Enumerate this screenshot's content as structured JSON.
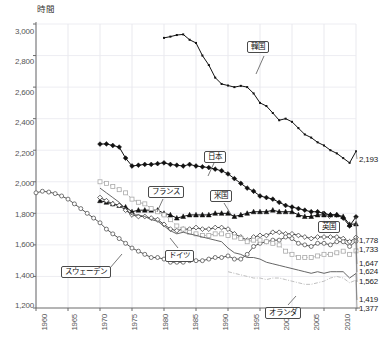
{
  "chart": {
    "type": "line",
    "yaxis_title": "時間",
    "ylabel": "時間",
    "xlabel": ""
  },
  "yticks": [
    "3,000",
    "2,800",
    "2,600",
    "2,400",
    "2,200",
    "2,000",
    "1,800",
    "1,600",
    "1,400",
    "1,200"
  ],
  "xticks": [
    "1960",
    "1965",
    "1970",
    "1975",
    "1980",
    "1985",
    "1990",
    "1995",
    "2000",
    "2005",
    "2010"
  ],
  "callouts": [
    {
      "name": "korea",
      "label": "韓国"
    },
    {
      "name": "japan",
      "label": "日本"
    },
    {
      "name": "france",
      "label": "フランス"
    },
    {
      "name": "usa",
      "label": "米国"
    },
    {
      "name": "uk",
      "label": "英国"
    },
    {
      "name": "germany",
      "label": "ドイツ"
    },
    {
      "name": "sweden",
      "label": "スウェーデン"
    },
    {
      "name": "netherlands",
      "label": "オランダ"
    }
  ],
  "end_labels": [
    {
      "name": "korea",
      "value": "2,193"
    },
    {
      "name": "japan",
      "value": "1,778"
    },
    {
      "name": "usa",
      "value": "1,733"
    },
    {
      "name": "uk",
      "value": "1,647"
    },
    {
      "name": "sweden",
      "value": "1,624"
    },
    {
      "name": "france",
      "value": "1,562"
    },
    {
      "name": "germany",
      "value": "1,419"
    },
    {
      "name": "netherlands",
      "value": "1,377"
    }
  ],
  "chart_data": {
    "type": "line",
    "title": "",
    "xlabel": "",
    "ylabel": "時間",
    "xlim": [
      1960,
      2010
    ],
    "ylim": [
      1200,
      3000
    ],
    "yticks": [
      1200,
      1400,
      1600,
      1800,
      2000,
      2200,
      2400,
      2600,
      2800,
      3000
    ],
    "xticks": [
      1960,
      1965,
      1970,
      1975,
      1980,
      1985,
      1990,
      1995,
      2000,
      2005,
      2010
    ],
    "grid": true,
    "legend": "callout-labels-on-plot",
    "series": [
      {
        "name": "韓国",
        "name_en": "Korea",
        "marker": "small-filled-square",
        "color": "#111111",
        "x": [
          1980,
          1981,
          1982,
          1983,
          1984,
          1985,
          1986,
          1987,
          1988,
          1989,
          1990,
          1991,
          1992,
          1993,
          1994,
          1995,
          1996,
          1997,
          1998,
          1999,
          2000,
          2001,
          2002,
          2003,
          2004,
          2005,
          2006,
          2007,
          2008,
          2009,
          2010
        ],
        "values": [
          2912,
          2920,
          2930,
          2934,
          2900,
          2880,
          2800,
          2740,
          2660,
          2620,
          2610,
          2600,
          2608,
          2600,
          2560,
          2500,
          2480,
          2436,
          2390,
          2400,
          2380,
          2340,
          2300,
          2280,
          2250,
          2230,
          2200,
          2180,
          2150,
          2120,
          2193
        ]
      },
      {
        "name": "日本",
        "name_en": "Japan",
        "marker": "filled-diamond",
        "color": "#111111",
        "x": [
          1970,
          1971,
          1972,
          1973,
          1974,
          1975,
          1976,
          1977,
          1978,
          1979,
          1980,
          1981,
          1982,
          1983,
          1984,
          1985,
          1986,
          1987,
          1988,
          1989,
          1990,
          1991,
          1992,
          1993,
          1994,
          1995,
          1996,
          1997,
          1998,
          1999,
          2000,
          2001,
          2002,
          2003,
          2004,
          2005,
          2006,
          2007,
          2008,
          2009,
          2010
        ],
        "values": [
          2239,
          2240,
          2230,
          2220,
          2150,
          2100,
          2105,
          2110,
          2110,
          2115,
          2120,
          2110,
          2105,
          2100,
          2110,
          2100,
          2095,
          2090,
          2080,
          2070,
          2050,
          2020,
          1990,
          1960,
          1940,
          1910,
          1900,
          1890,
          1870,
          1850,
          1840,
          1830,
          1820,
          1810,
          1810,
          1800,
          1790,
          1790,
          1770,
          1720,
          1778
        ]
      },
      {
        "name": "米国",
        "name_en": "USA",
        "marker": "filled-triangle",
        "color": "#111111",
        "x": [
          1970,
          1971,
          1972,
          1973,
          1974,
          1975,
          1976,
          1977,
          1978,
          1979,
          1980,
          1981,
          1982,
          1983,
          1984,
          1985,
          1986,
          1987,
          1988,
          1989,
          1990,
          1991,
          1992,
          1993,
          1994,
          1995,
          1996,
          1997,
          1998,
          1999,
          2000,
          2001,
          2002,
          2003,
          2004,
          2005,
          2006,
          2007,
          2008,
          2009,
          2010
        ],
        "values": [
          1880,
          1870,
          1860,
          1850,
          1840,
          1810,
          1820,
          1820,
          1820,
          1820,
          1800,
          1790,
          1770,
          1780,
          1790,
          1790,
          1790,
          1790,
          1800,
          1800,
          1800,
          1780,
          1790,
          1800,
          1810,
          1810,
          1810,
          1820,
          1810,
          1810,
          1810,
          1790,
          1780,
          1780,
          1790,
          1790,
          1790,
          1790,
          1780,
          1730,
          1733
        ]
      },
      {
        "name": "英国",
        "name_en": "UK",
        "marker": "open-diamond",
        "color": "#444444",
        "x": [
          1970,
          1971,
          1972,
          1973,
          1974,
          1975,
          1976,
          1977,
          1978,
          1979,
          1980,
          1981,
          1982,
          1983,
          1984,
          1985,
          1986,
          1987,
          1988,
          1989,
          1990,
          1991,
          1992,
          1993,
          1994,
          1995,
          1996,
          1997,
          1998,
          1999,
          2000,
          2001,
          2002,
          2003,
          2004,
          2005,
          2006,
          2007,
          2008,
          2009,
          2010
        ],
        "values": [
          1900,
          1880,
          1860,
          1850,
          1820,
          1790,
          1780,
          1780,
          1770,
          1760,
          1730,
          1700,
          1690,
          1700,
          1700,
          1710,
          1700,
          1700,
          1710,
          1710,
          1700,
          1670,
          1650,
          1630,
          1650,
          1660,
          1660,
          1680,
          1680,
          1670,
          1670,
          1660,
          1650,
          1640,
          1650,
          1650,
          1650,
          1650,
          1640,
          1620,
          1647
        ]
      },
      {
        "name": "スウェーデン",
        "name_en": "Sweden",
        "marker": "open-circle",
        "color": "#555555",
        "x": [
          1960,
          1961,
          1962,
          1963,
          1964,
          1965,
          1966,
          1967,
          1968,
          1969,
          1970,
          1971,
          1972,
          1973,
          1974,
          1975,
          1976,
          1977,
          1978,
          1979,
          1980,
          1981,
          1982,
          1983,
          1984,
          1985,
          1986,
          1987,
          1988,
          1989,
          1990,
          1991,
          1992,
          1993,
          1994,
          1995,
          1996,
          1997,
          1998,
          1999,
          2000,
          2001,
          2002,
          2003,
          2004,
          2005,
          2006,
          2007,
          2008,
          2009,
          2010
        ],
        "values": [
          1930,
          1940,
          1935,
          1925,
          1910,
          1890,
          1860,
          1830,
          1800,
          1770,
          1740,
          1700,
          1670,
          1640,
          1610,
          1580,
          1560,
          1540,
          1520,
          1520,
          1510,
          1490,
          1490,
          1490,
          1500,
          1500,
          1500,
          1510,
          1520,
          1520,
          1530,
          1510,
          1510,
          1540,
          1590,
          1610,
          1620,
          1630,
          1630,
          1650,
          1640,
          1610,
          1600,
          1590,
          1610,
          1610,
          1600,
          1620,
          1620,
          1590,
          1624
        ]
      },
      {
        "name": "フランス",
        "name_en": "France",
        "marker": "open-square-dotted",
        "color": "#aaaaaa",
        "x": [
          1970,
          1971,
          1972,
          1973,
          1974,
          1975,
          1976,
          1977,
          1978,
          1979,
          1980,
          1981,
          1982,
          1983,
          1984,
          1985,
          1986,
          1987,
          1988,
          1989,
          1990,
          1991,
          1992,
          1993,
          1994,
          1995,
          1996,
          1997,
          1998,
          1999,
          2000,
          2001,
          2002,
          2003,
          2004,
          2005,
          2006,
          2007,
          2008,
          2009,
          2010
        ],
        "values": [
          2000,
          1990,
          1970,
          1950,
          1930,
          1890,
          1870,
          1860,
          1830,
          1810,
          1790,
          1760,
          1720,
          1700,
          1680,
          1670,
          1660,
          1660,
          1670,
          1670,
          1660,
          1650,
          1640,
          1620,
          1630,
          1630,
          1620,
          1610,
          1600,
          1560,
          1540,
          1520,
          1520,
          1520,
          1530,
          1540,
          1540,
          1550,
          1560,
          1540,
          1562
        ]
      },
      {
        "name": "ドイツ",
        "name_en": "Germany",
        "marker": "none-line",
        "color": "#666666",
        "x": [
          1970,
          1971,
          1972,
          1973,
          1974,
          1975,
          1976,
          1977,
          1978,
          1979,
          1980,
          1981,
          1982,
          1983,
          1984,
          1985,
          1986,
          1987,
          1988,
          1989,
          1990,
          1991,
          1992,
          1993,
          1994,
          1995,
          1996,
          1997,
          1998,
          1999,
          2000,
          2001,
          2002,
          2003,
          2004,
          2005,
          2006,
          2007,
          2008,
          2009,
          2010
        ],
        "values": [
          1960,
          1930,
          1900,
          1870,
          1830,
          1790,
          1790,
          1780,
          1760,
          1750,
          1720,
          1690,
          1670,
          1680,
          1670,
          1660,
          1650,
          1640,
          1630,
          1620,
          1580,
          1550,
          1540,
          1520,
          1520,
          1510,
          1490,
          1480,
          1470,
          1460,
          1450,
          1440,
          1430,
          1420,
          1430,
          1420,
          1430,
          1430,
          1430,
          1390,
          1419
        ]
      },
      {
        "name": "オランダ",
        "name_en": "Netherlands",
        "marker": "dash-dot",
        "color": "#c0c0c0",
        "x": [
          1990,
          1991,
          1992,
          1993,
          1994,
          1995,
          1996,
          1997,
          1998,
          1999,
          2000,
          2001,
          2002,
          2003,
          2004,
          2005,
          2006,
          2007,
          2008,
          2009,
          2010
        ],
        "values": [
          1430,
          1420,
          1410,
          1400,
          1390,
          1390,
          1380,
          1390,
          1390,
          1380,
          1370,
          1360,
          1350,
          1350,
          1360,
          1370,
          1390,
          1400,
          1390,
          1360,
          1377
        ]
      }
    ]
  }
}
